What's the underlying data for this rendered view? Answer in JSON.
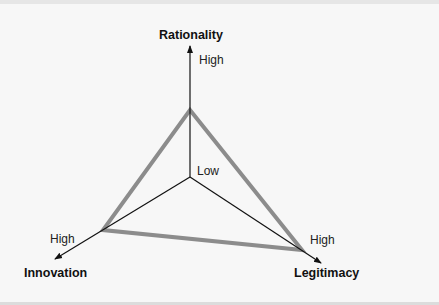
{
  "diagram": {
    "type": "radar-triangle",
    "axes": [
      {
        "name": "Rationality",
        "high_label": "High"
      },
      {
        "name": "Innovation",
        "high_label": "High"
      },
      {
        "name": "Legitimacy",
        "high_label": "High"
      }
    ],
    "center_label": "Low",
    "colors": {
      "axis": "#111111",
      "triangle": "#8c8c8c",
      "background": "#f7f7f7"
    }
  }
}
